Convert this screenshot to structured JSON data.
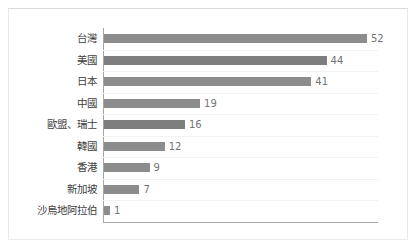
{
  "chart_data": {
    "type": "bar",
    "orientation": "horizontal",
    "title": "",
    "subtitle": "",
    "xlabel": "",
    "ylabel": "",
    "categories": [
      "台灣",
      "美國",
      "日本",
      "中國",
      "歐盟、瑞士",
      "韓國",
      "香港",
      "新加坡",
      "沙烏地阿拉伯"
    ],
    "values": [
      52,
      44,
      41,
      19,
      16,
      12,
      9,
      7,
      1
    ],
    "value_labels": [
      "52",
      "44",
      "41",
      "19",
      "16",
      "12",
      "9",
      "7",
      "1"
    ],
    "xlim": [
      0,
      55
    ],
    "grid": true,
    "grid_axis": "y",
    "legend": false,
    "legend_position": "none",
    "tick_labels_x": [],
    "annotations": [],
    "colors": {
      "bar": "#8c8c8c",
      "bar_alt": "#7e7e7e",
      "axis": "#a6a6a6",
      "gridline": "#f2f2f2",
      "label_text": "#404040",
      "value_text": "#737373",
      "background": "#ffffff",
      "frame": "#e9e9e9"
    }
  }
}
